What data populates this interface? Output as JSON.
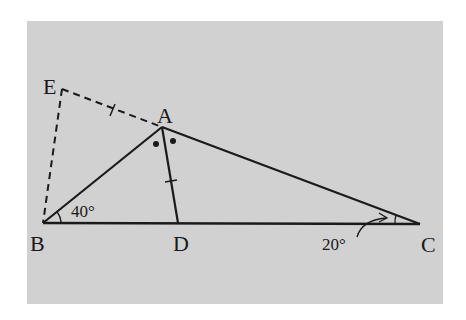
{
  "diagram": {
    "background_color": "#d1d1d1",
    "line_color": "#1a1a1a",
    "points": {
      "A": {
        "label": "A",
        "x": 162,
        "y": 127
      },
      "B": {
        "label": "B",
        "x": 43,
        "y": 223
      },
      "C": {
        "label": "C",
        "x": 420,
        "y": 224
      },
      "D": {
        "label": "D",
        "x": 178,
        "y": 223
      },
      "E": {
        "label": "E",
        "x": 62,
        "y": 89
      }
    },
    "segments": {
      "solid": [
        "AB",
        "AC",
        "BC",
        "AD"
      ],
      "dashed": [
        "EA",
        "EB"
      ]
    },
    "equal_marks": [
      "EA",
      "AD"
    ],
    "angle_marks": {
      "B": {
        "value_label": "40°"
      },
      "C": {
        "value_label": "20°"
      },
      "A_bisector_dots": 2
    }
  }
}
